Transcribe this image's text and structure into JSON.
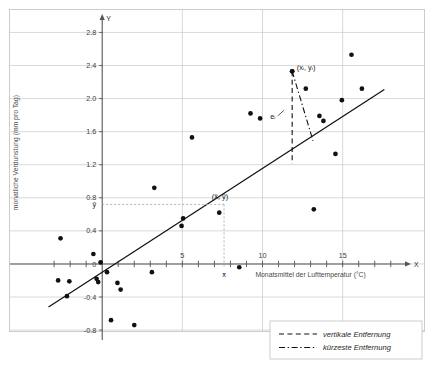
{
  "chart_data": {
    "type": "scatter",
    "title": "",
    "xlabel": "Monatsmittel der Lufttemperatur (°C)",
    "ylabel": "monatliche Verdunstung (mm pro Tag)",
    "xlim": [
      -3.6,
      19.2
    ],
    "ylim": [
      -0.92,
      2.92
    ],
    "xticks_labeled": [
      5,
      10,
      15
    ],
    "xtick_labels": [
      "5",
      "10",
      "15"
    ],
    "xtick_step_minor": 1,
    "yticks": [
      -0.8,
      -0.4,
      0,
      0.4,
      0.8,
      1.2,
      1.6,
      2.0,
      2.4,
      2.8
    ],
    "ytick_labels": [
      "-0.8",
      "-0.4",
      "0",
      "0.4",
      "0.8",
      "1.2",
      "1.6",
      "2.0",
      "2.4",
      "2.8"
    ],
    "grid": true,
    "x_axis_letter": "X",
    "y_axis_letter": "Y",
    "points": [
      [
        -2.75,
        -0.2
      ],
      [
        -2.6,
        0.31
      ],
      [
        -2.05,
        -0.21
      ],
      [
        -2.2,
        -0.39
      ],
      [
        -0.55,
        0.12
      ],
      [
        -0.35,
        -0.18
      ],
      [
        -0.25,
        -0.22
      ],
      [
        -0.1,
        0.02
      ],
      [
        0.3,
        -0.1
      ],
      [
        0.95,
        -0.23
      ],
      [
        1.15,
        -0.31
      ],
      [
        0.55,
        -0.68
      ],
      [
        2.0,
        -0.74
      ],
      [
        3.1,
        -0.1
      ],
      [
        3.25,
        0.92
      ],
      [
        4.95,
        0.46
      ],
      [
        5.05,
        0.55
      ],
      [
        5.6,
        1.53
      ],
      [
        7.3,
        0.62
      ],
      [
        8.55,
        -0.04
      ],
      [
        9.25,
        1.82
      ],
      [
        9.85,
        1.76
      ],
      [
        11.85,
        2.33
      ],
      [
        12.7,
        2.12
      ],
      [
        13.2,
        0.66
      ],
      [
        13.55,
        1.79
      ],
      [
        13.8,
        1.73
      ],
      [
        14.55,
        1.33
      ],
      [
        14.95,
        1.98
      ],
      [
        15.55,
        2.53
      ],
      [
        16.2,
        2.12
      ]
    ],
    "regression_line": {
      "label": "Regressionsgerade",
      "x_start": -3.35,
      "y_start": -0.52,
      "x_end": 17.6,
      "y_end": 2.11
    },
    "annotations": {
      "point_label": "(xᵢ, yᵢ)",
      "residual_label": "eᵢ",
      "mean_point_label": "(x̄, ȳ)",
      "x_mean_label": "x̄",
      "y_mean_label": "ȳ",
      "x_mean_value": 7.6,
      "y_mean_value": 0.72,
      "highlight_point": [
        11.85,
        2.33
      ],
      "vertical_drop_to_y": 1.21,
      "perpendicular_foot": [
        13.15,
        1.49
      ]
    },
    "legend": {
      "position": "bottom-right",
      "entries": [
        {
          "label": "vertikale Entfernung",
          "style": "dashed"
        },
        {
          "label": "kürzeste Entfernung",
          "style": "dash-dot"
        }
      ]
    },
    "colors": {
      "point": "#111111",
      "line": "#111111",
      "grid": "#c9c9c9",
      "axis": "#555555",
      "mean_guide": "#aaaaaa",
      "frame": "#c0c0c0"
    }
  }
}
